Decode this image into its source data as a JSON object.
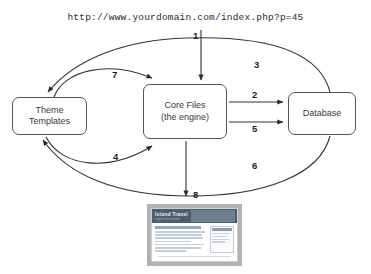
{
  "diagram": {
    "url_request": "http://www.yourdomain.com/index.php?p=45",
    "nodes": [
      {
        "id": "theme",
        "label": "Theme\nTemplates"
      },
      {
        "id": "core",
        "label": "Core Files\n(the engine)"
      },
      {
        "id": "database",
        "label": "Database"
      }
    ],
    "edges": [
      {
        "num": "1",
        "from": "url",
        "to": "core",
        "desc": "request enters core files"
      },
      {
        "num": "2",
        "from": "core",
        "to": "database",
        "desc": "core queries database"
      },
      {
        "num": "3",
        "from": "database",
        "to": "theme",
        "desc": "arc over top to theme templates"
      },
      {
        "num": "4",
        "from": "theme",
        "to": "core",
        "desc": "theme returns to core"
      },
      {
        "num": "5",
        "from": "core",
        "to": "database",
        "desc": "second core to database call"
      },
      {
        "num": "6",
        "from": "database",
        "to": "theme",
        "desc": "arc under bottom to theme templates"
      },
      {
        "num": "7",
        "from": "theme",
        "to": "core",
        "desc": "theme templates to core files"
      },
      {
        "num": "8",
        "from": "core",
        "to": "page",
        "desc": "rendered page output"
      }
    ],
    "output_page": {
      "site_title": "Island Travel",
      "site_tagline": "explore the islands"
    },
    "colors": {
      "line": "#333333",
      "box_border": "#555555",
      "text": "#3a3a3a",
      "banner": "#4d5d70",
      "frame": "#b2b2b2"
    }
  }
}
